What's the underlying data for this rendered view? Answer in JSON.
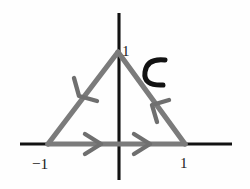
{
  "figure": {
    "background_color": "#fefefe",
    "axis_color": "#121212",
    "contour_color": "#7b7b7b",
    "label_color": "#1b1b1b"
  },
  "axes": {
    "x_axis": {
      "name": "x-axis",
      "from": [
        20,
        144
      ],
      "to": [
        232,
        144
      ]
    },
    "y_axis": {
      "name": "y-axis",
      "from": [
        119,
        13
      ],
      "to": [
        119,
        180
      ]
    }
  },
  "contour": {
    "name": "C",
    "label": "C",
    "shape": "triangle",
    "orientation": "clockwise",
    "vertices": [
      {
        "name": "left-vertex",
        "point": [
          48,
          144
        ],
        "label": "−1"
      },
      {
        "name": "right-vertex",
        "point": [
          185,
          144
        ],
        "label": "1"
      },
      {
        "name": "apex-vertex",
        "point": [
          118,
          52
        ],
        "label": "1"
      }
    ],
    "edges": [
      {
        "name": "bottom-edge",
        "from": [
          48,
          144
        ],
        "to": [
          185,
          144
        ],
        "arrow_direction": "right"
      },
      {
        "name": "right-edge",
        "from": [
          185,
          144
        ],
        "to": [
          118,
          52
        ],
        "arrow_direction": "up-left"
      },
      {
        "name": "left-edge",
        "from": [
          118,
          52
        ],
        "to": [
          48,
          144
        ],
        "arrow_direction": "down-left"
      }
    ],
    "arrow_count": 4
  },
  "labels": {
    "apex_one": "1",
    "left_neg_one": "−1",
    "right_one": "1",
    "curve_name": "C"
  }
}
